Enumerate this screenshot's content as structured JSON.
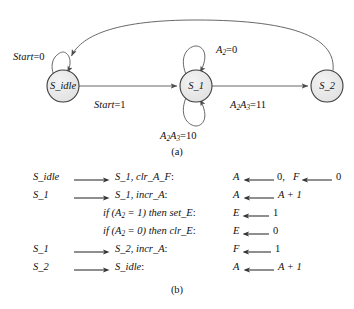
{
  "figure": {
    "part_a_caption": "(a)",
    "part_b_caption": "(b)"
  },
  "state_diagram": {
    "states": [
      {
        "id": "s_idle",
        "label": "S_idle",
        "cx": 63,
        "cy": 86,
        "r": 16
      },
      {
        "id": "s_1",
        "label": "S_1",
        "cx": 196,
        "cy": 86,
        "r": 16
      },
      {
        "id": "s_2",
        "label": "S_2",
        "cx": 327,
        "cy": 86,
        "r": 16
      }
    ],
    "transitions": [
      {
        "id": "idle-self-loop",
        "from": "S_idle",
        "to": "S_idle",
        "condition_text": "Start = 0",
        "condition_var": "Start",
        "condition_value": "0"
      },
      {
        "id": "idle-to-s1",
        "from": "S_idle",
        "to": "S_1",
        "condition_text": "Start = 1",
        "condition_var": "Start",
        "condition_value": "1"
      },
      {
        "id": "s1-self-loop-top",
        "from": "S_1",
        "to": "S_1",
        "condition_text": "A2 = 0",
        "condition_var": "A",
        "condition_sub": "2",
        "condition_value": "0"
      },
      {
        "id": "s1-self-loop-bottom",
        "from": "S_1",
        "to": "S_1",
        "condition_text": "A2A3 = 10",
        "condition_value": "10"
      },
      {
        "id": "s1-to-s2",
        "from": "S_1",
        "to": "S_2",
        "condition_text": "A2A3 = 11",
        "condition_value": "11"
      },
      {
        "id": "s2-to-idle",
        "from": "S_2",
        "to": "S_idle",
        "condition_text": ""
      }
    ],
    "labels": {
      "start_0": {
        "var": "Start",
        "eq": "=",
        "value": "0"
      },
      "start_1": {
        "var": "Start",
        "eq": "=",
        "value": "1"
      },
      "a2_0": {
        "var": "A",
        "sub": "2",
        "eq": "=",
        "value": "0"
      },
      "a2a3_10": {
        "var1": "A",
        "sub1": "2",
        "var2": "A",
        "sub2": "3",
        "eq": "=",
        "value": "10"
      },
      "a2a3_11": {
        "var1": "A",
        "sub1": "2",
        "var2": "A",
        "sub2": "3",
        "eq": "=",
        "value": "11"
      }
    }
  },
  "rtl_listing": {
    "rows": [
      {
        "id": "row-1",
        "from": "S_idle",
        "has_arrow": true,
        "to": "S_1, clr_A_F:",
        "to_state": "S_1",
        "to_action": "clr_A_F",
        "operations": [
          {
            "dest": "A",
            "value": "0,"
          },
          {
            "dest": "F",
            "value": "0"
          }
        ],
        "op_text": "A ← 0, F ← 0"
      },
      {
        "id": "row-2",
        "from": "S_1",
        "has_arrow": true,
        "to": "S_1, incr_A:",
        "to_state": "S_1",
        "to_action": "incr_A",
        "operations": [
          {
            "dest": "A",
            "value": "A + 1"
          }
        ],
        "op_text": "A ← A + 1"
      },
      {
        "id": "row-3",
        "from": "",
        "has_arrow": false,
        "to": "if (A2 = 1) then set_E:",
        "condition": "if (A2 = 1) then",
        "to_action": "set_E",
        "operations": [
          {
            "dest": "E",
            "value": "1"
          }
        ],
        "op_text": "E ← 1"
      },
      {
        "id": "row-4",
        "from": "",
        "has_arrow": false,
        "to": "if (A2 = 0) then clr_E:",
        "condition": "if (A2 = 0) then",
        "to_action": "clr_E",
        "operations": [
          {
            "dest": "E",
            "value": "0"
          }
        ],
        "op_text": "E ← 0"
      },
      {
        "id": "row-5",
        "from": "S_1",
        "has_arrow": true,
        "to": "S_2, incr_A:",
        "to_state": "S_2",
        "to_action": "incr_A",
        "operations": [
          {
            "dest": "F",
            "value": "1"
          }
        ],
        "op_text": "F ← 1"
      },
      {
        "id": "row-6",
        "from": "S_2",
        "has_arrow": true,
        "to": "S_idle:",
        "to_state": "S_idle",
        "to_action": "",
        "operations": [
          {
            "dest": "A",
            "value": "A + 1"
          }
        ],
        "op_text": "A ← A + 1"
      }
    ]
  },
  "colors": {
    "stroke": "#4d4d4d",
    "state_fill": "#e8e8e8",
    "text": "#111111",
    "background": "#ffffff"
  }
}
